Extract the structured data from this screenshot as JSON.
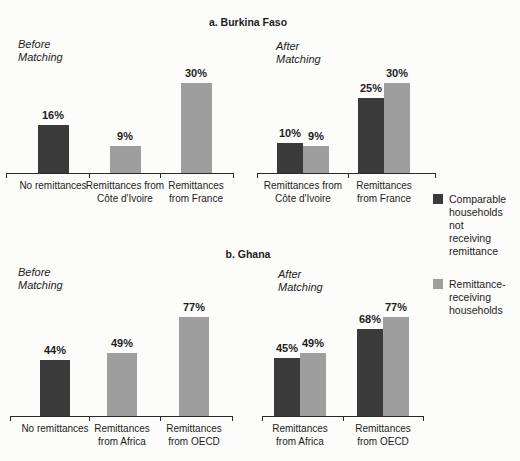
{
  "colors": {
    "comparable": "#3a3a3a",
    "remittance": "#9e9e9e",
    "axis": "#2a2a2a",
    "text": "#1d1d1d",
    "background": "#fcfcfa"
  },
  "legend": {
    "items": [
      {
        "series": "comparable",
        "label": "Comparable\nhouseholds not\nreceiving\nremittance"
      },
      {
        "series": "remittance",
        "label": "Remittance-\nreceiving\nhouseholds"
      }
    ]
  },
  "chart_data": [
    {
      "type": "bar",
      "title": "a. Burkina Faso",
      "unit": "%",
      "ylim": [
        0,
        35
      ],
      "legend_position": "right",
      "grid": false,
      "panels": [
        {
          "condition": "Before\nMatching",
          "groups": [
            {
              "category": "No remittances",
              "bars": [
                {
                  "series": "comparable",
                  "value": 16,
                  "label": "16%"
                }
              ]
            },
            {
              "category": "Remittances from\nCôte d'Ivoire",
              "bars": [
                {
                  "series": "remittance",
                  "value": 9,
                  "label": "9%"
                }
              ]
            },
            {
              "category": "Remittances\nfrom France",
              "bars": [
                {
                  "series": "remittance",
                  "value": 30,
                  "label": "30%"
                }
              ]
            }
          ]
        },
        {
          "condition": "After\nMatching",
          "groups": [
            {
              "category": "Remittances from\nCôte d'Ivoire",
              "bars": [
                {
                  "series": "comparable",
                  "value": 10,
                  "label": "10%"
                },
                {
                  "series": "remittance",
                  "value": 9,
                  "label": "9%"
                }
              ]
            },
            {
              "category": "Remittances\nfrom France",
              "bars": [
                {
                  "series": "comparable",
                  "value": 25,
                  "label": "25%"
                },
                {
                  "series": "remittance",
                  "value": 30,
                  "label": "30%"
                }
              ]
            }
          ]
        }
      ]
    },
    {
      "type": "bar",
      "title": "b. Ghana",
      "unit": "%",
      "ylim": [
        0,
        85
      ],
      "legend_position": "right",
      "grid": false,
      "panels": [
        {
          "condition": "Before\nMatching",
          "groups": [
            {
              "category": "No remittances",
              "bars": [
                {
                  "series": "comparable",
                  "value": 44,
                  "label": "44%"
                }
              ]
            },
            {
              "category": "Remittances\nfrom Africa",
              "bars": [
                {
                  "series": "remittance",
                  "value": 49,
                  "label": "49%"
                }
              ]
            },
            {
              "category": "Remittances\nfrom OECD",
              "bars": [
                {
                  "series": "remittance",
                  "value": 77,
                  "label": "77%"
                }
              ]
            }
          ]
        },
        {
          "condition": "After\nMatching",
          "groups": [
            {
              "category": "Remittances\nfrom Africa",
              "bars": [
                {
                  "series": "comparable",
                  "value": 45,
                  "label": "45%"
                },
                {
                  "series": "remittance",
                  "value": 49,
                  "label": "49%"
                }
              ]
            },
            {
              "category": "Remittances\nfrom OECD",
              "bars": [
                {
                  "series": "comparable",
                  "value": 68,
                  "label": "68%"
                },
                {
                  "series": "remittance",
                  "value": 77,
                  "label": "77%"
                }
              ]
            }
          ]
        }
      ]
    }
  ]
}
